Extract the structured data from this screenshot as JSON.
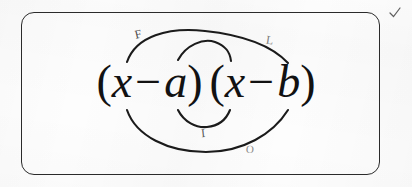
{
  "document": {
    "kind": "scanned-worksheet-figure",
    "topic": "FOIL method",
    "background_color": "#fdfdfd",
    "ink_color": "#1b1b1b"
  },
  "box": {
    "shape": "rounded-rectangle",
    "border_color": "#2b2b2b"
  },
  "expression": {
    "full_text": "(x − a)(x − b)",
    "factor_one": {
      "open_paren": "(",
      "variable": "x",
      "operator": "−",
      "term": "a",
      "close_paren": ")"
    },
    "factor_two": {
      "open_paren": "(",
      "variable": "x",
      "operator": "−",
      "term": "b",
      "close_paren": ")"
    }
  },
  "annotations": {
    "labels": [
      {
        "id": "first",
        "letter": "F",
        "meaning": "First",
        "position": "top-left",
        "color": "#4a4a4a"
      },
      {
        "id": "last",
        "letter": "L",
        "meaning": "Last",
        "position": "top-right",
        "color": "#7d7d7d"
      },
      {
        "id": "inner",
        "letter": "I",
        "meaning": "Inner",
        "position": "bottom-center",
        "color": "#5a5a5a"
      },
      {
        "id": "outer",
        "letter": "O",
        "meaning": "Outer",
        "position": "bottom-right",
        "color": "#8a8a8a"
      }
    ],
    "arcs": [
      {
        "id": "arc-first",
        "label": "F",
        "side": "top",
        "span": "wide",
        "from": "x of first factor",
        "to": "b of second factor"
      },
      {
        "id": "arc-last",
        "label": "L",
        "side": "top",
        "span": "narrow",
        "from": "a of first factor",
        "to": "x of second factor"
      },
      {
        "id": "arc-inner",
        "label": "I",
        "side": "bottom",
        "span": "narrow",
        "from": "a of first factor",
        "to": "x of second factor"
      },
      {
        "id": "arc-outer",
        "label": "O",
        "side": "bottom",
        "span": "wide",
        "from": "x of first factor",
        "to": "b of second factor"
      }
    ],
    "stray_marks": [
      {
        "id": "tick",
        "glyph": "✓",
        "position": "outside-top-right",
        "color": "#5f5f5f"
      }
    ]
  },
  "showthrough": {
    "note": "faint reverse-side print bleed visible in scan",
    "rows": [
      "",
      "",
      "",
      ""
    ]
  }
}
